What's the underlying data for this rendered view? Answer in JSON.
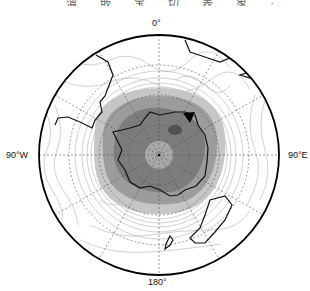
{
  "caption": "渭 嵌 宝 切 表 象  ·",
  "map": {
    "projection": "south-polar-stereographic",
    "labels": {
      "top": "0°",
      "left": "90°W",
      "right": "90°E",
      "bottom": "180°"
    },
    "colors": {
      "boundary": "#000000",
      "coastline": "#111111",
      "graticule": "#555555",
      "contour": "#aaaaaa",
      "shade_light": "#c8c8c8",
      "shade_mid": "#9a9a9a",
      "shade_dark": "#7a7a7a",
      "shade_darkest": "#505050"
    }
  }
}
